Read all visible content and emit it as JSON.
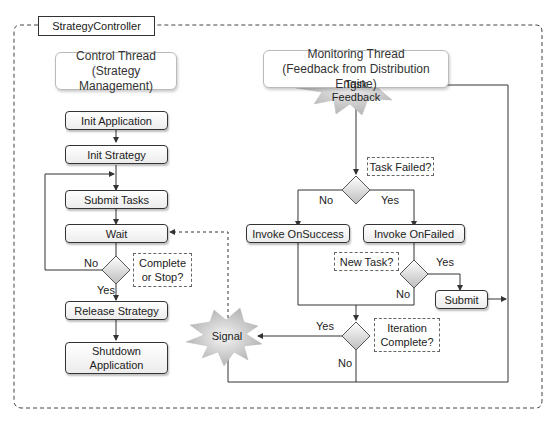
{
  "diagram": {
    "container_title": "StrategyController",
    "control_thread": {
      "header_line1": "Control Thread",
      "header_line2": "(Strategy Management)",
      "steps": [
        "Init Application",
        "Init Strategy",
        "Submit Tasks",
        "Wait",
        "Release Strategy"
      ],
      "shutdown_line1": "Shutdown",
      "shutdown_line2": "Application",
      "decision_line1": "Complete",
      "decision_line2": "or Stop?",
      "no_label": "No",
      "yes_label": "Yes"
    },
    "monitoring_thread": {
      "header_line1": "Monitoring Thread",
      "header_line2": "(Feedback from Distribution Engine)",
      "event_line1": "Task",
      "event_line2": "Feedback",
      "task_failed_note": "Task Failed?",
      "no_label": "No",
      "yes_label": "Yes",
      "invoke_success": "Invoke OnSuccess",
      "invoke_failed": "Invoke OnFailed",
      "new_task_note": "New Task?",
      "new_task_yes": "Yes",
      "new_task_no": "No",
      "submit": "Submit",
      "iteration_line1": "Iteration",
      "iteration_line2": "Complete?",
      "iteration_yes": "Yes",
      "iteration_no": "No",
      "signal": "Signal"
    }
  }
}
